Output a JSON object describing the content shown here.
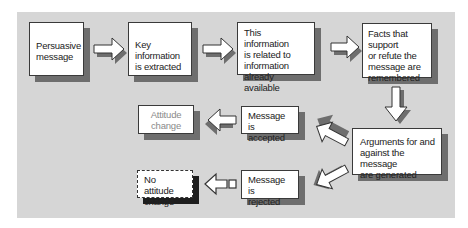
{
  "diagram": {
    "title": "",
    "nodes": [
      {
        "id": "persuasive-message",
        "label": "Persuasive message",
        "lines": [
          "Persuasive",
          "message"
        ]
      },
      {
        "id": "key-info",
        "label": "Key information is extracted",
        "lines": [
          "Key information",
          "is extracted"
        ]
      },
      {
        "id": "related-info",
        "label": "This information is related to information already available",
        "lines": [
          "This information",
          "is related to",
          "information already",
          "available"
        ]
      },
      {
        "id": "facts-remembered",
        "label": "Facts that support or refute the message are remembered",
        "lines": [
          "Facts that support",
          "or refute the",
          "message are",
          "remembered"
        ]
      },
      {
        "id": "arguments-generated",
        "label": "Arguments for and against the message are generated",
        "lines": [
          "Arguments for and",
          "against the message",
          "are generated"
        ]
      },
      {
        "id": "message-accepted",
        "label": "Message is accepted",
        "lines": [
          "Message is",
          "accepted"
        ]
      },
      {
        "id": "attitude-change",
        "label": "Attitude change",
        "lines": [
          "Attitude",
          "change"
        ]
      },
      {
        "id": "message-rejected",
        "label": "Message is rejected",
        "lines": [
          "Message is",
          "rejected"
        ]
      },
      {
        "id": "no-attitude-change",
        "label": "No attitude change",
        "lines": [
          "No attitude",
          "change"
        ]
      }
    ],
    "edges": [
      {
        "from": "persuasive-message",
        "to": "key-info",
        "direction": "right"
      },
      {
        "from": "key-info",
        "to": "related-info",
        "direction": "right"
      },
      {
        "from": "related-info",
        "to": "facts-remembered",
        "direction": "right"
      },
      {
        "from": "facts-remembered",
        "to": "arguments-generated",
        "direction": "down"
      },
      {
        "from": "arguments-generated",
        "to": "message-accepted",
        "direction": "up-left"
      },
      {
        "from": "arguments-generated",
        "to": "message-rejected",
        "direction": "down-left"
      },
      {
        "from": "message-accepted",
        "to": "attitude-change",
        "direction": "left"
      },
      {
        "from": "message-rejected",
        "to": "no-attitude-change",
        "direction": "left",
        "style": "outline-with-square"
      }
    ],
    "colors": {
      "panel": "#d6d6d6",
      "box_fill": "#ffffff",
      "shadow": "#6e6e6e",
      "dark_shadow": "#1e1e1e",
      "muted_text": "#8a8a8a"
    }
  }
}
